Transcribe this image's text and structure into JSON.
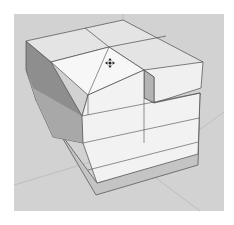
{
  "viewport": {
    "label": "3D model viewport",
    "background": "#ffffff",
    "canvas_color": "#d2d2d2",
    "edge_color": "#4a4a4a",
    "faces": {
      "top_light": "#e4e4e4",
      "top_selected": "#f7f7f7",
      "front": "#f2f2f2",
      "side_dark": "#8e8e8e",
      "side_mid": "#b4b4b4",
      "inner_frame": "#c4c4c4"
    }
  },
  "cursor": {
    "icon": "move-icon",
    "x": 110,
    "y": 63
  },
  "model": {
    "name": "box-with-cutout"
  }
}
